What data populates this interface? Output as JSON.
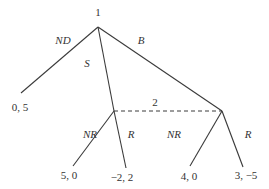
{
  "diagram": {
    "type": "extensive-form game tree",
    "nodes": {
      "root": {
        "player": "1",
        "x": 98,
        "y": 27
      },
      "left_decision": {
        "player": "2",
        "x": 114,
        "y": 111
      },
      "right_decision": {
        "player": "2",
        "x": 222,
        "y": 111
      }
    },
    "information_set_label": "2",
    "actions": {
      "nd": "ND",
      "s": "S",
      "b": "B",
      "left_nr": "NR",
      "left_r": "R",
      "right_nr": "NR",
      "right_r": "R"
    },
    "payoffs": {
      "nd": "0, 5",
      "s_nr": "5, 0",
      "s_r": "−2, 2",
      "b_nr": "4, 0",
      "b_r": "3, −5"
    }
  }
}
